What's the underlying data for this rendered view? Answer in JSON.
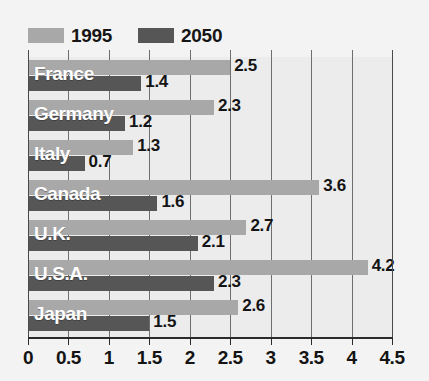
{
  "chart_data": {
    "type": "bar",
    "orientation": "horizontal",
    "title": "",
    "xlabel": "",
    "ylabel": "",
    "xlim": [
      0,
      4.5
    ],
    "xticks": [
      "0",
      "0.5",
      "1",
      "1.5",
      "2",
      "2.5",
      "3",
      "3.5",
      "4",
      "4.5"
    ],
    "grid": true,
    "legend_position": "top-left",
    "categories": [
      "France",
      "Germany",
      "Italy",
      "Canada",
      "U.K.",
      "U.S.A.",
      "Japan"
    ],
    "series": [
      {
        "name": "1995",
        "color": "#a8a8a8",
        "values": [
          2.5,
          2.3,
          1.3,
          3.6,
          2.7,
          4.2,
          2.6
        ],
        "labels": [
          "2.5",
          "2.3",
          "1.3",
          "3.6",
          "2.7",
          "4.2",
          "2.6"
        ]
      },
      {
        "name": "2050",
        "color": "#565656",
        "values": [
          1.4,
          1.2,
          0.7,
          1.6,
          2.1,
          2.3,
          1.5
        ],
        "labels": [
          "1.4",
          "1.2",
          "0.7",
          "1.6",
          "2.1",
          "2.3",
          "1.5"
        ]
      }
    ]
  },
  "legend": {
    "entries": [
      {
        "label": "1995",
        "color": "#a8a8a8"
      },
      {
        "label": "2050",
        "color": "#565656"
      }
    ]
  },
  "colors": {
    "background": "#f3f3f3",
    "plot_background": "#ececed",
    "gridline": "#6e6e6e",
    "axis": "#2b2b2b",
    "series_1995": "#a8a8a8",
    "series_2050": "#565656",
    "country_label": "#ffffff",
    "value_label": "#141414"
  }
}
